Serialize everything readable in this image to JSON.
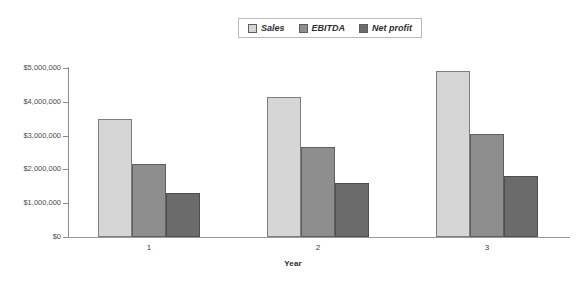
{
  "chart_data": {
    "type": "bar",
    "title": "",
    "xlabel": "Year",
    "ylabel": "",
    "categories": [
      "1",
      "2",
      "3"
    ],
    "series": [
      {
        "name": "Sales",
        "color": "#d6d6d6",
        "values": [
          3500000,
          4150000,
          4900000
        ]
      },
      {
        "name": "EBITDA",
        "color": "#8e8e8e",
        "values": [
          2150000,
          2650000,
          3050000
        ]
      },
      {
        "name": "Net profit",
        "color": "#6b6b6b",
        "values": [
          1300000,
          1600000,
          1800000
        ]
      }
    ],
    "ylim": [
      0,
      5000000
    ],
    "ytick_values": [
      0,
      1000000,
      2000000,
      3000000,
      4000000,
      5000000
    ],
    "ytick_labels": [
      "$0",
      "$1,000,000",
      "$2,000,000",
      "$3,000,000",
      "$4,000,000",
      "$5,000,000"
    ],
    "grid": false,
    "legend_position": "top-center"
  },
  "legend": {
    "entries": [
      {
        "label": "Sales"
      },
      {
        "label": "EBITDA"
      },
      {
        "label": "Net profit"
      }
    ]
  },
  "axes": {
    "x_title": "Year"
  }
}
